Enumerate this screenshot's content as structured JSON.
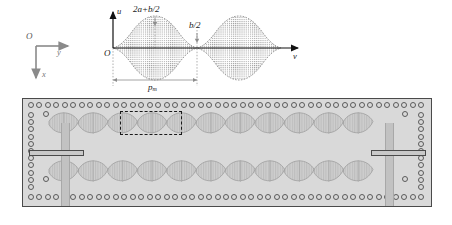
{
  "figure": {
    "domain": "diagram"
  },
  "coordinate_triad": {
    "origin_label": "O",
    "horizontal_axis_label": "y",
    "vertical_axis_label": "x"
  },
  "graph": {
    "origin_label": "O",
    "vertical_axis_label": "u",
    "horizontal_axis_label": "v",
    "peak_label": "2a+b/2",
    "node_label": "b/2",
    "period_label": "p",
    "period_subscript": "m"
  },
  "chart_data": {
    "type": "line",
    "title": "",
    "xlabel": "v",
    "ylabel": "u",
    "series": [
      {
        "name": "upper-envelope",
        "comment": "Envelope of modulated strip half-width: maxima 2a+b/2, minima b/2",
        "x": [
          0.0,
          0.05,
          0.1,
          0.15,
          0.2,
          0.25,
          0.3,
          0.35,
          0.4,
          0.45,
          0.5,
          0.55,
          0.6,
          0.65,
          0.7,
          0.75,
          0.8,
          0.85,
          0.9,
          0.95,
          1.0,
          1.05,
          1.1,
          1.15,
          1.2,
          1.25,
          1.3,
          1.35,
          1.4,
          1.45,
          1.5,
          1.55,
          1.6,
          1.65,
          1.7,
          1.75,
          1.8,
          1.85,
          1.9,
          1.95,
          2.0
        ],
        "y": [
          0.14,
          0.19,
          0.33,
          0.52,
          0.73,
          0.92,
          1.07,
          1.14,
          1.14,
          1.07,
          0.92,
          0.73,
          0.52,
          0.33,
          0.19,
          0.14,
          0.19,
          0.33,
          0.52,
          0.73,
          0.92,
          1.07,
          1.14,
          1.14,
          1.07,
          0.92,
          0.73,
          0.52,
          0.33,
          0.19,
          0.14,
          0.19,
          0.33,
          0.52,
          0.73,
          0.92,
          1.07,
          1.14,
          1.07,
          0.7,
          0.2
        ]
      },
      {
        "name": "lower-envelope",
        "comment": "Mirror of upper envelope about the v-axis",
        "x": [
          0.0,
          0.5,
          1.0,
          1.5,
          2.0
        ],
        "y": [
          -0.14,
          -0.92,
          -0.92,
          -0.14,
          -0.2
        ]
      }
    ],
    "annotations": [
      {
        "text": "2a+b/2",
        "x": 0.36,
        "y": 1.14,
        "role": "maximum-amplitude"
      },
      {
        "text": "b/2",
        "x": 0.78,
        "y": 0.14,
        "role": "minimum-amplitude"
      },
      {
        "text": "p_m",
        "x": 0.38,
        "y": -1.3,
        "role": "modulation-period"
      }
    ],
    "axis_ranges": {
      "x": [
        0,
        2.05
      ],
      "y": [
        -1.4,
        1.4
      ]
    },
    "grid": false,
    "legend": "none"
  },
  "plate": {
    "label": "perforated-plate",
    "hole_rows": {
      "top_count": 47,
      "bottom_count": 47,
      "left_column_count": 11,
      "right_column_count": 11
    },
    "strips": {
      "rows": 2,
      "cells_per_row": 11,
      "shape": "lens"
    },
    "selected_unit_cells": 2
  }
}
